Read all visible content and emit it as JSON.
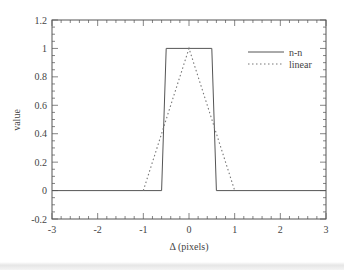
{
  "chart_data": {
    "type": "line",
    "title": "",
    "xlabel": "Δ (pixels)",
    "ylabel": "value",
    "xlim": [
      -3,
      3
    ],
    "ylim": [
      -0.2,
      1.2
    ],
    "xticks": [
      -3,
      -2,
      -1,
      0,
      1,
      2,
      3
    ],
    "xtick_labels": [
      "-3",
      "-2",
      "-1",
      "0",
      "1",
      "2",
      "3"
    ],
    "yticks": [
      -0.2,
      0,
      0.2,
      0.4,
      0.6,
      0.8,
      1,
      1.2
    ],
    "ytick_labels": [
      "-0.2",
      "0",
      "0.2",
      "0.4",
      "0.6",
      "0.8",
      "1",
      "1.2"
    ],
    "grid": false,
    "legend_position": "upper right",
    "series": [
      {
        "name": "n-n",
        "style": "solid",
        "x": [
          -3,
          -0.6,
          -0.5,
          0.5,
          0.6,
          3
        ],
        "y": [
          0,
          0,
          1,
          1,
          0,
          0
        ]
      },
      {
        "name": "linear",
        "style": "dotted",
        "x": [
          -1,
          0,
          1
        ],
        "y": [
          0,
          1,
          0
        ]
      }
    ]
  }
}
